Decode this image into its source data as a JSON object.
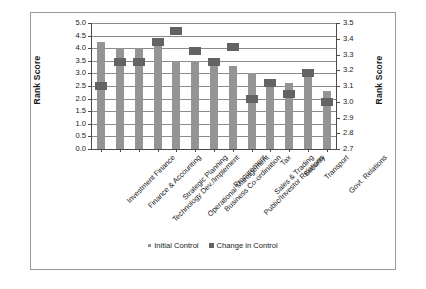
{
  "chart_data": {
    "type": "bar",
    "title": "",
    "xlabel": "",
    "ylabel": "Rank Score",
    "ylabel_right": "Rank Score",
    "grid": true,
    "legend_position": "bottom",
    "ylim": [
      0.0,
      5.0
    ],
    "ylim_right": [
      2.7,
      3.5
    ],
    "yticks": [
      "0.0",
      "0.5",
      "1.0",
      "1.5",
      "2.0",
      "2.5",
      "3.0",
      "3.5",
      "4.0",
      "4.5",
      "5.0"
    ],
    "yticks_right": [
      "2.7",
      "2.8",
      "2.9",
      "3.0",
      "3.1",
      "3.2",
      "3.3",
      "3.4",
      "3.5"
    ],
    "categories": [
      "Investment Finance",
      "Finance & Accounting",
      "Technology Dev./Implement",
      "Strategic Planning",
      "Operational Management",
      "Business Co-ordination",
      "Procurement",
      "Public/Investor Relations",
      "Sales & Trading",
      "Tax",
      "Security",
      "Transport",
      "Govt. Relations"
    ],
    "series": [
      {
        "name": "Initial Control",
        "axis": "left",
        "render": "bar",
        "color": "#949494",
        "values": [
          4.25,
          4.0,
          4.0,
          4.35,
          3.5,
          3.5,
          3.45,
          3.3,
          3.0,
          2.75,
          2.6,
          2.85,
          2.3
        ]
      },
      {
        "name": "Change in Control",
        "axis": "right",
        "render": "marker",
        "color": "#636363",
        "values": [
          3.1,
          3.25,
          3.25,
          3.38,
          3.45,
          3.32,
          3.25,
          3.35,
          3.02,
          3.12,
          3.05,
          3.18,
          3.0
        ]
      }
    ]
  },
  "legend": {
    "items": [
      {
        "label": "Initial Control"
      },
      {
        "label": "Change in Control"
      }
    ]
  },
  "colors": {
    "bar": "#949494",
    "marker": "#636363",
    "grid": "#8c8c8c",
    "axis": "#4a4a4a",
    "border": "#9a9a9a",
    "text": "#1a1a1a"
  }
}
